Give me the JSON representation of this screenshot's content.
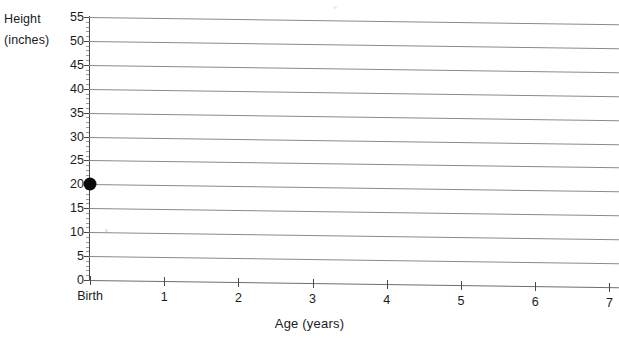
{
  "chart_data": {
    "type": "scatter",
    "title": "",
    "xlabel": "Age (years)",
    "ylabel": "Height (inches)",
    "ylabel_line1": "Height",
    "ylabel_line2": "(inches)",
    "xlim": [
      0,
      7
    ],
    "ylim": [
      0,
      55
    ],
    "x_tick_labels": [
      "Birth",
      "1",
      "2",
      "3",
      "4",
      "5",
      "6",
      "7"
    ],
    "x_tick_values": [
      0,
      1,
      2,
      3,
      4,
      5,
      6,
      7
    ],
    "y_tick_labels": [
      "0",
      "5",
      "10",
      "15",
      "20",
      "25",
      "30",
      "35",
      "40",
      "45",
      "50",
      "55"
    ],
    "y_tick_values": [
      0,
      5,
      10,
      15,
      20,
      25,
      30,
      35,
      40,
      45,
      50,
      55
    ],
    "y_minor_tick_interval": 1,
    "grid": true,
    "grid_orientation": "horizontal",
    "grid_color": "#8a8a8a",
    "legend": null,
    "series": [
      {
        "name": "Height measurement",
        "marker": "filled-circle",
        "color": "#0b0b0b",
        "points": [
          {
            "x": 0,
            "x_label": "Birth",
            "y": 20
          }
        ]
      }
    ],
    "annotations": []
  },
  "colors": {
    "background": "#ffffff",
    "axis": "#4a4a4a",
    "gridline": "#8a8a8a",
    "text": "#1b1b1b",
    "marker": "#0b0b0b"
  }
}
